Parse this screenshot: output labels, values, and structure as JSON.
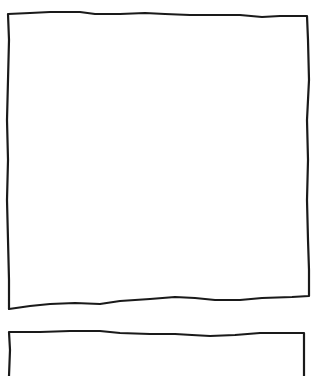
{
  "canvas": {
    "width": 320,
    "height": 376,
    "background": "#ffffff"
  },
  "stroke": {
    "color": "#1a1a1a",
    "width": 2.2
  },
  "shapes": [
    {
      "id": "box-1",
      "type": "hand-drawn-rectangle",
      "label": ""
    },
    {
      "id": "box-2",
      "type": "hand-drawn-rectangle-partial",
      "label": ""
    }
  ]
}
